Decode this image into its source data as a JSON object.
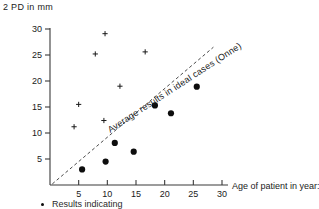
{
  "chart_data": {
    "type": "scatter",
    "title": "",
    "ylabel": "2 PD in mm",
    "xlabel": "Age of patient in year:",
    "xlim": [
      0,
      32
    ],
    "ylim": [
      0,
      31
    ],
    "xticks": [
      5,
      10,
      15,
      20,
      25,
      30
    ],
    "yticks": [
      5,
      10,
      15,
      20,
      25,
      30
    ],
    "grid": false,
    "legend_position": "below-axis",
    "annotations": [
      {
        "text": "Average results in ideal cases (Onne)",
        "kind": "rotated-line-label",
        "rotation_deg": -33
      }
    ],
    "reference_line": {
      "label": "Average results in ideal cases (Onne)",
      "style": "dashed",
      "x_start": 0.4,
      "y_start": 0.2,
      "x_end": 28.5,
      "y_end": 26.5
    },
    "series": [
      {
        "name": "Results indicating two-point discrimination (crosses)",
        "marker": "cross",
        "points": [
          {
            "x": 4.2,
            "y": 11.2
          },
          {
            "x": 5.0,
            "y": 15.5
          },
          {
            "x": 7.9,
            "y": 25.2
          },
          {
            "x": 9.4,
            "y": 12.4
          },
          {
            "x": 9.6,
            "y": 29.1
          },
          {
            "x": 12.2,
            "y": 19.0
          },
          {
            "x": 16.6,
            "y": 25.6
          }
        ]
      },
      {
        "name": "Results indicating poor discrimination (dots)",
        "marker": "dot",
        "points": [
          {
            "x": 5.6,
            "y": 3.0
          },
          {
            "x": 9.7,
            "y": 4.5
          },
          {
            "x": 11.3,
            "y": 8.1
          },
          {
            "x": 14.6,
            "y": 6.4
          },
          {
            "x": 18.3,
            "y": 15.3
          },
          {
            "x": 21.1,
            "y": 13.8
          },
          {
            "x": 25.6,
            "y": 18.9
          }
        ]
      }
    ]
  },
  "axis": {
    "y_label_text": "2 PD in mm",
    "x_label_text": "Age of patient in year:",
    "tick_labels_x": [
      "5",
      "10",
      "15",
      "20",
      "25",
      "30"
    ],
    "tick_labels_y": [
      "5",
      "10",
      "15",
      "20",
      "25",
      "30"
    ]
  },
  "legend": {
    "footnote": "Results indicating"
  },
  "colors": {
    "ink": "#1a1a1a",
    "marker": "#0d0d0d",
    "axis": "#3a3a3a",
    "trendline": "#4a4a4a",
    "background": "#ffffff"
  }
}
